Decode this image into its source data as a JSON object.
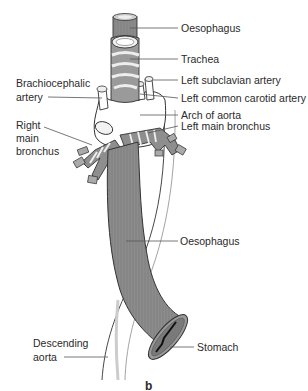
{
  "diagram": {
    "type": "anatomical illustration",
    "sublabel": "b",
    "colors": {
      "muscle": "#8a8a8a",
      "muscle_dark": "#6e6e6e",
      "cartilage": "#e8e8e8",
      "outline": "#333333",
      "vessel": "#ffffff",
      "leader": "#555555"
    },
    "labels": {
      "oesophagus_top": "Oesophagus",
      "trachea": "Trachea",
      "left_subclavian": "Left subclavian artery",
      "brachiocephalic_line1": "Brachiocephalic",
      "brachiocephalic_line2": "artery",
      "left_common_carotid": "Left common carotid artery",
      "arch_of_aorta": "Arch of aorta",
      "right_main_bronchus_line1": "Right",
      "right_main_bronchus_line2": "main",
      "right_main_bronchus_line3": "bronchus",
      "left_main_bronchus": "Left main bronchus",
      "oesophagus_mid": "Oesophagus",
      "descending_aorta_line1": "Descending",
      "descending_aorta_line2": "aorta",
      "stomach": "Stomach"
    }
  }
}
